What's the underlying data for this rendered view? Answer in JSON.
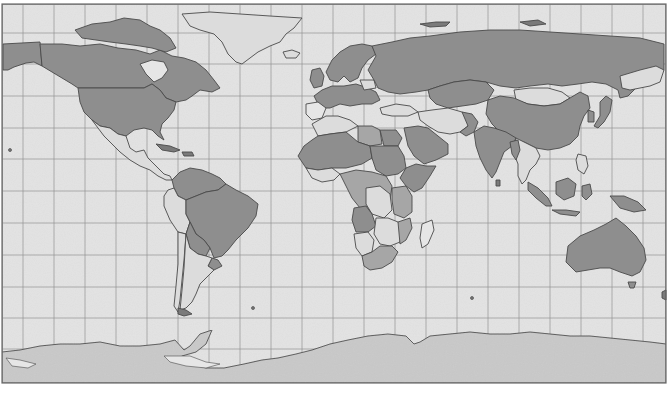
{
  "map": {
    "projection": "equirectangular",
    "colors": {
      "ocean": "#e3e3e3",
      "frame": "#6a6a6a",
      "grid": "#8f8f8f",
      "land_dark": "#8e8e8e",
      "land_medium": "#a6a6a6",
      "land_light": "#dcdcdc",
      "antarctica": "#c9c9c9",
      "border": "#4a4a4a"
    },
    "grid": {
      "vertical_lines_x": [
        23,
        54,
        85,
        116,
        147,
        178,
        209,
        240,
        271,
        302,
        333,
        364,
        395,
        426,
        457,
        488,
        519,
        550,
        581,
        612,
        643
      ],
      "horizontal_lines_y": [
        33,
        64,
        96,
        128,
        159,
        191,
        223,
        255,
        287,
        318,
        349
      ]
    },
    "regions": [
      {
        "name": "North America (USA/Canada)",
        "shade": "dark"
      },
      {
        "name": "Greenland",
        "shade": "light"
      },
      {
        "name": "Mexico & Central America",
        "shade": "light"
      },
      {
        "name": "South America (Brazil, Venezuela, Bolivia, Colombia)",
        "shade": "dark"
      },
      {
        "name": "Peru / Chile / Argentina",
        "shade": "light"
      },
      {
        "name": "Europe",
        "shade": "dark"
      },
      {
        "name": "Russia",
        "shade": "dark"
      },
      {
        "name": "Mongolia",
        "shade": "light"
      },
      {
        "name": "China",
        "shade": "dark"
      },
      {
        "name": "Middle East (Iran/Iraq)",
        "shade": "light"
      },
      {
        "name": "India",
        "shade": "dark"
      },
      {
        "name": "Southeast Asia",
        "shade": "light"
      },
      {
        "name": "Indonesia",
        "shade": "dark"
      },
      {
        "name": "Australia",
        "shade": "dark"
      },
      {
        "name": "Africa (mixed)",
        "shade": "mixed"
      },
      {
        "name": "Madagascar",
        "shade": "light"
      },
      {
        "name": "Antarctica",
        "shade": "antarctica"
      }
    ]
  }
}
